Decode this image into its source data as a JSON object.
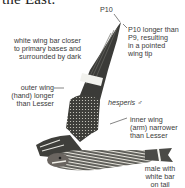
{
  "page": {
    "top_text": "the East.",
    "illustration": {
      "subject": "nighthawk in flight",
      "subspecies_label": "hesperis",
      "sex_symbol": "♂"
    },
    "annotations": [
      {
        "id": "p10",
        "text": "P10"
      },
      {
        "id": "p10-longer",
        "lines": [
          "P10 longer than",
          "P9, resulting",
          "in a pointed",
          "wing tip"
        ]
      },
      {
        "id": "white-wing-bar",
        "lines": [
          "white wing bar closer",
          "to primary bases and",
          "surrounded by dark"
        ]
      },
      {
        "id": "outer-wing",
        "lines": [
          "outer wing",
          "(hand) longer",
          "than Lesser"
        ]
      },
      {
        "id": "inner-wing",
        "lines": [
          "inner wing",
          "(arm) narrower",
          "than Lesser"
        ]
      },
      {
        "id": "male-tail",
        "lines": [
          "male with",
          "white bar",
          "on tail"
        ]
      }
    ]
  }
}
